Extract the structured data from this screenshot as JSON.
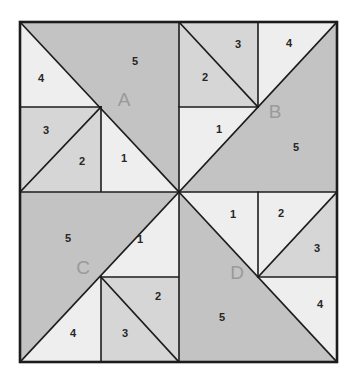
{
  "figure": {
    "type": "geometric-dissection-diagram",
    "colors": {
      "shade_dark": "#c3c3c3",
      "shade_medium": "#d6d6d6",
      "shade_light": "#eeeeee",
      "stroke": "#1c1c1c",
      "label_letter": "#9a9a9a",
      "label_number": "#262626",
      "background": "#ffffff"
    },
    "geometry": {
      "outer_left": 20,
      "outer_top": 22,
      "outer_right": 337,
      "outer_bottom": 362,
      "center_x": 179,
      "center_y": 192,
      "split_x_left": 101,
      "split_x_right": 258,
      "split_y_top": 107,
      "split_y_bottom": 277
    }
  },
  "quadrants": [
    {
      "id": "A",
      "label": "A",
      "label_x": 124,
      "label_y": 101,
      "regions": [
        {
          "n": "1",
          "x": 124,
          "y": 159,
          "shade": "light"
        },
        {
          "n": "2",
          "x": 82,
          "y": 162,
          "shade": "medium"
        },
        {
          "n": "3",
          "x": 46,
          "y": 131,
          "shade": "medium"
        },
        {
          "n": "4",
          "x": 41,
          "y": 79,
          "shade": "light"
        },
        {
          "n": "5",
          "x": 135,
          "y": 62,
          "shade": "dark"
        }
      ]
    },
    {
      "id": "B",
      "label": "B",
      "label_x": 275,
      "label_y": 113,
      "regions": [
        {
          "n": "1",
          "x": 219,
          "y": 130,
          "shade": "light"
        },
        {
          "n": "2",
          "x": 205,
          "y": 78,
          "shade": "medium"
        },
        {
          "n": "3",
          "x": 238,
          "y": 45,
          "shade": "medium"
        },
        {
          "n": "4",
          "x": 289,
          "y": 44,
          "shade": "light"
        },
        {
          "n": "5",
          "x": 296,
          "y": 148,
          "shade": "dark"
        }
      ]
    },
    {
      "id": "C",
      "label": "C",
      "label_x": 83,
      "label_y": 269,
      "regions": [
        {
          "n": "1",
          "x": 140,
          "y": 240,
          "shade": "light"
        },
        {
          "n": "2",
          "x": 158,
          "y": 297,
          "shade": "medium"
        },
        {
          "n": "3",
          "x": 125,
          "y": 334,
          "shade": "medium"
        },
        {
          "n": "4",
          "x": 73,
          "y": 334,
          "shade": "light"
        },
        {
          "n": "5",
          "x": 68,
          "y": 239,
          "shade": "dark"
        }
      ]
    },
    {
      "id": "D",
      "label": "D",
      "label_x": 237,
      "label_y": 274,
      "regions": [
        {
          "n": "1",
          "x": 233,
          "y": 215,
          "shade": "light"
        },
        {
          "n": "2",
          "x": 281,
          "y": 214,
          "shade": "light"
        },
        {
          "n": "3",
          "x": 317,
          "y": 249,
          "shade": "medium"
        },
        {
          "n": "4",
          "x": 320,
          "y": 305,
          "shade": "light"
        },
        {
          "n": "5",
          "x": 222,
          "y": 318,
          "shade": "dark"
        }
      ]
    }
  ]
}
